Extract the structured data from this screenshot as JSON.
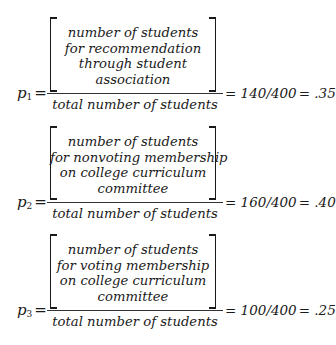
{
  "equations": [
    {
      "variable": "p",
      "subscript": "1",
      "equals": "=",
      "numerator_lines": [
        "number of students",
        "for recommendation",
        "through student",
        "association"
      ],
      "denominator": "total number of students",
      "rhs_equals": "=",
      "ratio": "140/400",
      "result_equals": "=",
      "result": ".35"
    },
    {
      "variable": "p",
      "subscript": "2",
      "equals": "=",
      "numerator_lines": [
        "number of students",
        "for nonvoting membership",
        "on college curriculum",
        "committee"
      ],
      "denominator": "total number of students",
      "rhs_equals": "=",
      "ratio": "160/400",
      "result_equals": "=",
      "result": ".40"
    },
    {
      "variable": "p",
      "subscript": "3",
      "equals": "=",
      "numerator_lines": [
        "number of students",
        "for voting membership",
        "on college curriculum",
        "committee"
      ],
      "denominator": "total number of students",
      "rhs_equals": "=",
      "ratio": "100/400",
      "result_equals": "=",
      "result": ".25"
    }
  ]
}
